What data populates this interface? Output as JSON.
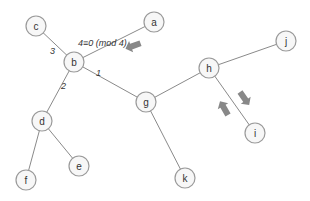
{
  "diagram": {
    "type": "tree",
    "nodes": [
      {
        "id": "a",
        "label": "a"
      },
      {
        "id": "b",
        "label": "b"
      },
      {
        "id": "c",
        "label": "c"
      },
      {
        "id": "d",
        "label": "d"
      },
      {
        "id": "e",
        "label": "e"
      },
      {
        "id": "f",
        "label": "f"
      },
      {
        "id": "g",
        "label": "g"
      },
      {
        "id": "h",
        "label": "h"
      },
      {
        "id": "i",
        "label": "i"
      },
      {
        "id": "j",
        "label": "j"
      },
      {
        "id": "k",
        "label": "k"
      }
    ],
    "edges": [
      {
        "from": "b",
        "to": "a",
        "label": ""
      },
      {
        "from": "b",
        "to": "c",
        "label": "3"
      },
      {
        "from": "b",
        "to": "d",
        "label": "2"
      },
      {
        "from": "b",
        "to": "g",
        "label": "1"
      },
      {
        "from": "d",
        "to": "e",
        "label": ""
      },
      {
        "from": "d",
        "to": "f",
        "label": ""
      },
      {
        "from": "g",
        "to": "h",
        "label": ""
      },
      {
        "from": "g",
        "to": "k",
        "label": ""
      },
      {
        "from": "h",
        "to": "j",
        "label": ""
      },
      {
        "from": "h",
        "to": "i",
        "label": ""
      }
    ],
    "annotation": "4≡0 (mod 4)",
    "arrows": [
      {
        "name": "arrow-toward-b",
        "direction": "down-left"
      },
      {
        "name": "arrow-toward-i",
        "direction": "down-right"
      },
      {
        "name": "arrow-toward-h",
        "direction": "up-left"
      }
    ],
    "colors": {
      "edge": "#8a8a8a",
      "node_stroke": "#9a9a9a",
      "node_fill": "#f7f7f7",
      "arrow": "#888888"
    }
  }
}
